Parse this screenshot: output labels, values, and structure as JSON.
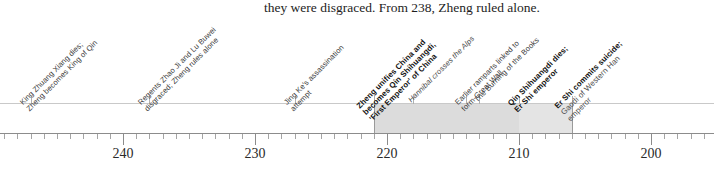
{
  "body_text": "they were disgraced. From 238, Zheng ruled alone.",
  "chart_data": {
    "type": "timeline",
    "title": "",
    "xlabel": "",
    "ylabel": "",
    "axis": {
      "orientation": "horizontal",
      "direction": "descending-bc",
      "unit": "years BC",
      "range_start": 249,
      "range_end": 195,
      "minor_tick_interval": 1,
      "major_tick_interval": 10,
      "major_ticks": [
        240,
        230,
        220,
        210,
        200
      ],
      "tick_labels": [
        "240",
        "230",
        "220",
        "210",
        "200"
      ],
      "grid": false,
      "legend": "none"
    },
    "eras": [
      {
        "name": "Qin Shihuangdi reign as First Emperor",
        "start": 221,
        "end": 210,
        "shade": "#dcdcdc"
      },
      {
        "name": "Er Shi emperor",
        "start": 210,
        "end": 206,
        "shade": "#e4e4e4"
      }
    ],
    "events": [
      {
        "year": 247,
        "style": "plain",
        "lines": [
          "King Zhuang Xiang dies;",
          "Zheng becomes King of Qin"
        ]
      },
      {
        "year": 238,
        "style": "plain",
        "lines": [
          "Regents Zhao Ji and Lu Buwei",
          "disgraced; Zheng rules alone"
        ]
      },
      {
        "year": 227,
        "style": "plain",
        "lines": [
          "Jing Ke's assassination",
          "attempt"
        ]
      },
      {
        "year": 221,
        "style": "bold",
        "lines": [
          "Zheng unifies China and",
          "becomes Qin Shihuangdi,",
          "'First Emperor' of China"
        ]
      },
      {
        "year": 218,
        "style": "italic",
        "lines": [
          "Hannibal crosses the Alps"
        ]
      },
      {
        "year": 214,
        "style": "plain",
        "lines": [
          "Earlier ramparts linked to",
          "form Great Wall"
        ]
      },
      {
        "year": 213,
        "style": "plain",
        "lines": [
          "The Burning of the Books"
        ]
      },
      {
        "year": 210,
        "style": "bold",
        "lines": [
          "Qin Shihuangdi dies;",
          "Er Shi emperor"
        ]
      },
      {
        "year": 206,
        "style": "bold-sub",
        "lines": [
          "Er Shi commits suicide;"
        ],
        "sub_lines": [
          "Gaodi of Western Han",
          "emperor"
        ]
      }
    ]
  }
}
